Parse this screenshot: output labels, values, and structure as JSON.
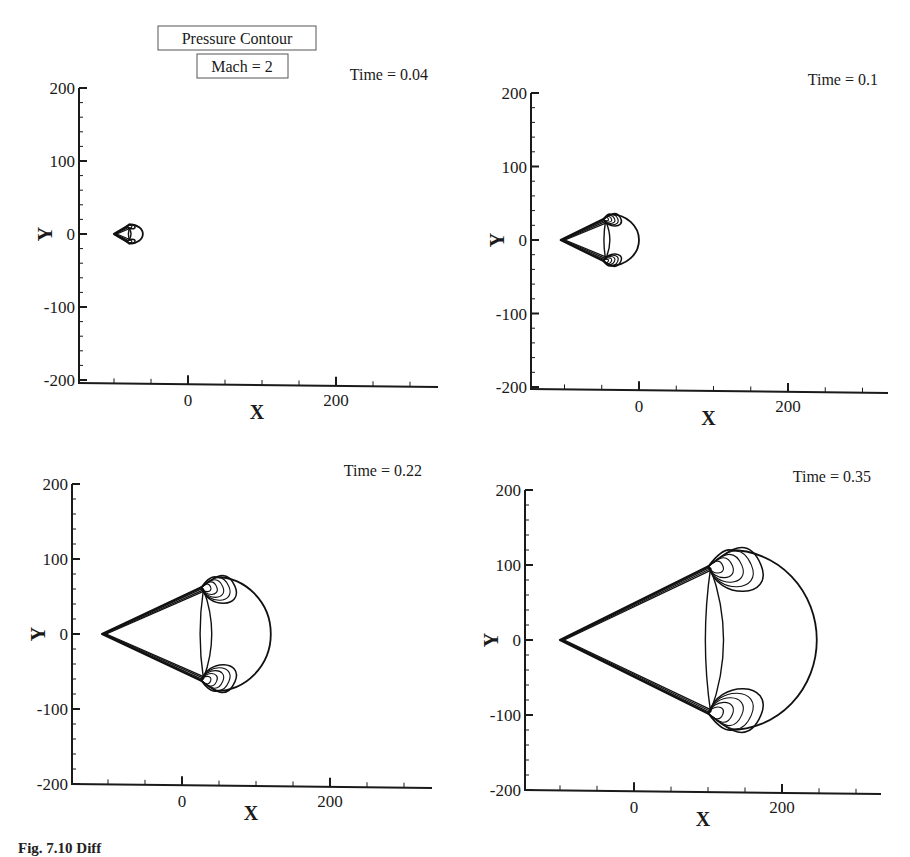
{
  "title_boxes": {
    "line1": "Pressure Contour",
    "line2": "Mach = 2"
  },
  "caption": "Fig. 7.10  Diff",
  "chart_data": [
    {
      "type": "contour",
      "title": "Pressure Contour",
      "subtitle": "Mach = 2",
      "annotation": "Time = 0.04",
      "time": 0.04,
      "xlabel": "X",
      "ylabel": "Y",
      "xticks": [
        0,
        200
      ],
      "yticks": [
        200,
        100,
        0,
        -100,
        -200
      ],
      "xlim": [
        -147,
        340
      ],
      "ylim": [
        -200,
        200
      ],
      "grid": false,
      "shock": {
        "apex": [
          -100,
          0
        ],
        "center_x": -78,
        "radius_x": 17,
        "radius_y": 13
      },
      "panel_px": {
        "x0": 79,
        "x_zero": 188,
        "x_200": 336,
        "x_end": 438,
        "y_200": 88,
        "y_zero": 234,
        "y_m200": 383
      }
    },
    {
      "type": "contour",
      "annotation": "Time = 0.1",
      "time": 0.1,
      "xlabel": "X",
      "ylabel": "Y",
      "xticks": [
        0,
        200
      ],
      "yticks": [
        200,
        100,
        0,
        -100,
        -200
      ],
      "xlim": [
        -147,
        340
      ],
      "ylim": [
        -200,
        200
      ],
      "grid": false,
      "shock": {
        "apex": [
          -105,
          0
        ],
        "center_x": -38,
        "radius_x": 38,
        "radius_y": 35
      },
      "panel_px": {
        "x0": 531,
        "x_zero": 639,
        "x_200": 788,
        "x_end": 888,
        "y_200": 93,
        "y_zero": 240,
        "y_m200": 389
      }
    },
    {
      "type": "contour",
      "annotation": "Time = 0.22",
      "time": 0.22,
      "xlabel": "X",
      "ylabel": "Y",
      "xticks": [
        0,
        200
      ],
      "yticks": [
        200,
        100,
        0,
        -100,
        -200
      ],
      "xlim": [
        -147,
        340
      ],
      "ylim": [
        -200,
        200
      ],
      "grid": false,
      "shock": {
        "apex": [
          -108,
          0
        ],
        "center_x": 45,
        "radius_x": 75,
        "radius_y": 76
      },
      "panel_px": {
        "x0": 72,
        "x_zero": 182,
        "x_200": 330,
        "x_end": 432,
        "y_200": 484,
        "y_zero": 634,
        "y_m200": 784
      }
    },
    {
      "type": "contour",
      "annotation": "Time = 0.35",
      "time": 0.35,
      "xlabel": "X",
      "ylabel": "Y",
      "xticks": [
        0,
        200
      ],
      "yticks": [
        200,
        100,
        0,
        -100,
        -200
      ],
      "xlim": [
        -147,
        340
      ],
      "ylim": [
        -200,
        200
      ],
      "grid": false,
      "shock": {
        "apex": [
          -100,
          0
        ],
        "center_x": 130,
        "radius_x": 117,
        "radius_y": 120
      },
      "panel_px": {
        "x0": 525,
        "x_zero": 634,
        "x_200": 782,
        "x_end": 881,
        "y_200": 490,
        "y_zero": 640,
        "y_m200": 790
      }
    }
  ]
}
